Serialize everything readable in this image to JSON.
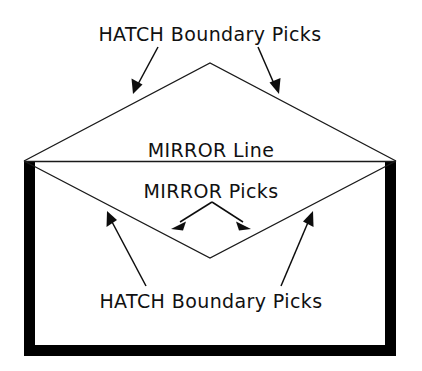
{
  "diagram": {
    "type": "technical-illustration",
    "background_color": "#ffffff",
    "line_color": "#1a1a1a",
    "thick_border_color": "#000000",
    "canvas": {
      "width": 422,
      "height": 371
    },
    "labels": {
      "top_hatch": "HATCH Boundary Picks",
      "mirror_line": "MIRROR Line",
      "mirror_picks": "MIRROR Picks",
      "bottom_hatch": "HATCH Boundary Picks"
    },
    "shapes": {
      "envelope_left_x": 24,
      "envelope_right_x": 396,
      "envelope_top_y": 161,
      "envelope_bottom_y": 356,
      "border_thickness": 11,
      "flap_apex": {
        "x": 210,
        "y": 63
      },
      "reflected_flap_vertex": {
        "x": 210,
        "y": 258
      },
      "mirror_line_y": 161
    },
    "annotations": [
      {
        "name": "top-left-leader",
        "label_ref": "top_hatch",
        "tail": {
          "x": 158,
          "y": 47
        },
        "tip": {
          "x": 133,
          "y": 94
        },
        "points_to": "upper flap left edge"
      },
      {
        "name": "top-right-leader",
        "label_ref": "top_hatch",
        "tail": {
          "x": 258,
          "y": 47
        },
        "tip": {
          "x": 279,
          "y": 94
        },
        "points_to": "upper flap right edge"
      },
      {
        "name": "mirror-pick-left-leader",
        "label_ref": "mirror_picks",
        "tail": {
          "x": 212,
          "y": 202
        },
        "tip": {
          "x": 171,
          "y": 229
        },
        "points_to": "mirror line left pick point"
      },
      {
        "name": "mirror-pick-right-leader",
        "label_ref": "mirror_picks",
        "tail": {
          "x": 212,
          "y": 202
        },
        "tip": {
          "x": 251,
          "y": 229
        },
        "points_to": "mirror line right pick point"
      },
      {
        "name": "bottom-left-leader",
        "label_ref": "bottom_hatch",
        "tail": {
          "x": 146,
          "y": 286
        },
        "tip": {
          "x": 107,
          "y": 211
        },
        "points_to": "reflected flap left edge"
      },
      {
        "name": "bottom-right-leader",
        "label_ref": "bottom_hatch",
        "tail": {
          "x": 281,
          "y": 286
        },
        "tip": {
          "x": 313,
          "y": 211
        },
        "points_to": "reflected flap right edge"
      }
    ],
    "label_positions": {
      "top_hatch": {
        "x": 210,
        "y": 41
      },
      "mirror_line": {
        "x": 211,
        "y": 157
      },
      "mirror_picks": {
        "x": 211,
        "y": 198
      },
      "bottom_hatch": {
        "x": 211,
        "y": 308
      }
    }
  }
}
